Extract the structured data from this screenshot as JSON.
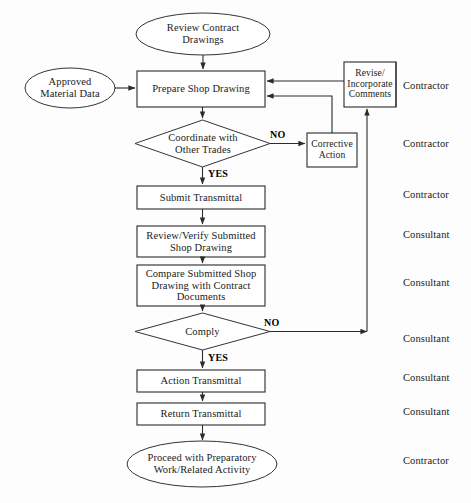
{
  "diagram": {
    "background_color": "#fdfdfd",
    "line_color": "#2b2b2b",
    "nodes": {
      "review_contract": {
        "label": "Review Contract\nDrawings",
        "shape": "ellipse"
      },
      "approved_material": {
        "label": "Approved\nMaterial Data",
        "shape": "ellipse"
      },
      "prepare_shop": {
        "label": "Prepare Shop Drawing",
        "shape": "process"
      },
      "revise_incorporate": {
        "label": "Revise/\nIncorporate\nComments",
        "shape": "process"
      },
      "coordinate": {
        "label": "Coordinate with\nOther Trades",
        "shape": "decision"
      },
      "corrective_action": {
        "label": "Corrective\nAction",
        "shape": "process"
      },
      "submit_transmittal": {
        "label": "Submit Transmittal",
        "shape": "process"
      },
      "review_verify": {
        "label": "Review/Verify Submitted\nShop Drawing",
        "shape": "process"
      },
      "compare_submitted": {
        "label": "Compare Submitted Shop\nDrawing with Contract\nDocuments",
        "shape": "process"
      },
      "comply": {
        "label": "Comply",
        "shape": "decision"
      },
      "action_transmittal": {
        "label": "Action Transmittal",
        "shape": "process"
      },
      "return_transmittal": {
        "label": "Return Transmittal",
        "shape": "process"
      },
      "proceed": {
        "label": "Proceed with Preparatory\nWork/Related Activity",
        "shape": "ellipse"
      }
    },
    "edge_labels": {
      "coordinate_no": "NO",
      "coordinate_yes": "YES",
      "comply_no": "NO",
      "comply_yes": "YES"
    },
    "roles": [
      {
        "label": "Contractor"
      },
      {
        "label": "Contractor"
      },
      {
        "label": "Contractor"
      },
      {
        "label": "Consultant"
      },
      {
        "label": "Consultant"
      },
      {
        "label": "Consultant"
      },
      {
        "label": "Consultant"
      },
      {
        "label": "Consultant"
      },
      {
        "label": "Contractor"
      }
    ]
  }
}
